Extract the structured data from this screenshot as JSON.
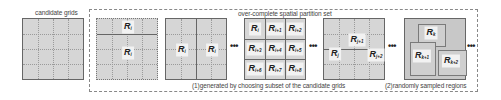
{
  "titles": {
    "candidate": "candidate grids",
    "overcomplete": "over-complete spatial partition set"
  },
  "captions": {
    "generated": "(1)generated by choosing subset of the candidate grids",
    "random": "(2)randomly sampled regions"
  },
  "ellipsis": "•••",
  "block1": {
    "labels": [
      {
        "base": "R",
        "sub": "i"
      },
      {
        "base": "R",
        "sub": "i"
      }
    ]
  },
  "block2": {
    "labels": [
      {
        "base": "R",
        "sub": "i"
      },
      {
        "base": "R",
        "sub": "i"
      }
    ]
  },
  "block3": {
    "labels": [
      {
        "base": "R",
        "sub": "i"
      },
      {
        "base": "R",
        "sub": "i+1"
      },
      {
        "base": "R",
        "sub": "i+2"
      },
      {
        "base": "R",
        "sub": "i+3"
      },
      {
        "base": "R",
        "sub": "i+4"
      },
      {
        "base": "R",
        "sub": "i+5"
      },
      {
        "base": "R",
        "sub": "i+6"
      },
      {
        "base": "R",
        "sub": "i+7"
      },
      {
        "base": "R",
        "sub": "i+8"
      }
    ]
  },
  "block4": {
    "labels": [
      {
        "base": "R",
        "sub": "j"
      },
      {
        "base": "R",
        "sub": "j+1"
      },
      {
        "base": "R",
        "sub": "j+2"
      }
    ]
  },
  "block5": {
    "labels": [
      {
        "base": "R",
        "sub": "k"
      },
      {
        "base": "R",
        "sub": "k+1"
      },
      {
        "base": "R",
        "sub": "k+2"
      }
    ]
  },
  "colors": {
    "grid_fill": "#d6d6d6",
    "border": "#666666",
    "label_bg": "#f2f2f2"
  }
}
